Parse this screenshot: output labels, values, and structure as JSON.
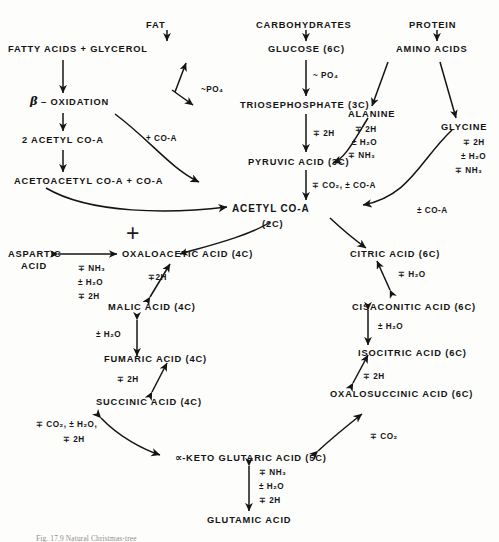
{
  "figure": {
    "type": "metabolic-pathway-diagram",
    "title_caption": "Fig. 17.9   Natural Christmas-tree",
    "symbols": {
      "plus_minus": "±",
      "minus_plus": "∓",
      "tilde_phosphate": "~PO₄",
      "junction_plus": "+"
    }
  },
  "nodes": {
    "fat": "FAT",
    "carbohydrates": "CARBOHYDRATES",
    "protein": "PROTEIN",
    "fatty_acids_glycerol": "FATTY ACIDS + GLYCEROL",
    "glucose": "GLUCOSE (6C)",
    "amino_acids": "AMINO ACIDS",
    "beta_oxidation_greek": "β",
    "beta_oxidation_rest": " – OXIDATION",
    "triosephosphate": "TRIOSEPHOSPHATE (3C)",
    "alanine": "ALANINE",
    "glycine": "GLYCINE",
    "two_acetyl_coa": "2 ACETYL CO-A",
    "pyruvic_acid": "PYRUVIC ACID (3C)",
    "acetoacetyl_coa": "ACETOACETYL CO-A + CO-A",
    "acetyl_coa": "ACETYL CO-A",
    "acetyl_coa_carbons": "(2C)",
    "aspartic_acid_line1": "ASPARTIC",
    "aspartic_acid_line2": "ACID",
    "oxaloacetic_acid": "OXALOACETIC ACID (4C)",
    "citric_acid": "CITRIC ACID (6C)",
    "malic_acid": "MALIC ACID (4C)",
    "cisaconitic_acid": "CISACONITIC ACID (6C)",
    "fumaric_acid": "FUMARIC ACID (4C)",
    "isocitric_acid": "ISOCITRIC ACID (6C)",
    "succinic_acid": "SUCCINIC ACID (4C)",
    "oxalosuccinic_acid": "OXALOSUCCINIC ACID (6C)",
    "keto_glutaric_greek": "∝",
    "keto_glutaric_rest": "-KETO GLUTARIC ACID (5C)",
    "glutamic_acid": "GLUTAMIC ACID"
  },
  "cofactors": {
    "po4_glycerol": "~PO₄",
    "po4_glucose": "~ PO₄",
    "plus_coa_upper": "+ CO-A",
    "two_h_triose": "∓ 2H",
    "co2_coa_pyruvate": "∓ CO₂, ± CO-A",
    "alanine_2h": "∓ 2H",
    "alanine_h2o": "± H₂O",
    "alanine_nh3": "∓ NH₃",
    "glycine_2h": "∓ 2H",
    "glycine_h2o": "± H₂O",
    "glycine_nh3": "∓ NH₃",
    "glycine_coa": "± CO-A",
    "aspartic_nh3": "∓ NH₃",
    "aspartic_h2o": "± H₂O",
    "aspartic_2h": "∓ 2H",
    "oxaloacetic_malic_2h": "∓2H",
    "malic_fumaric_h2o": "± H₂O",
    "fumaric_succinic_2h": "∓ 2H",
    "succinic_keto_line1": "∓ CO₂, ± H₂O,",
    "succinic_keto_line2": "∓ 2H",
    "citric_cisaconitic_h2o": "∓ H₂O",
    "cisaconitic_isocitric_h2o": "± H₂O",
    "isocitric_oxalo_2h": "∓ 2H",
    "oxalo_keto_co2": "∓ CO₂",
    "glutamic_nh3": "∓ NH₃",
    "glutamic_h2o": "± H₂O",
    "glutamic_2h": "∓ 2H"
  }
}
